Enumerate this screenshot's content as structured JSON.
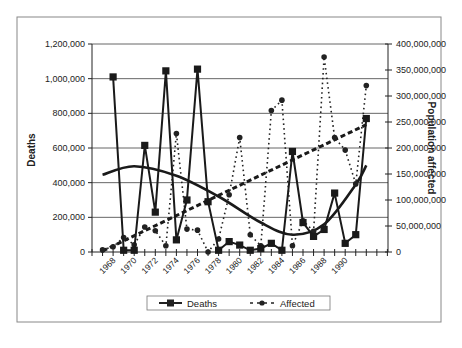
{
  "chart_data": {
    "type": "line",
    "title": "",
    "xlabel": "",
    "ylabel": "Deaths",
    "y2label": "Population affected",
    "ylim": [
      0,
      1200000
    ],
    "y2lim": [
      0,
      400000000
    ],
    "y_ticks": [
      "0",
      "200,000",
      "400,000",
      "600,000",
      "800,000",
      "1,000,000",
      "1,200,000"
    ],
    "y2_ticks": [
      "0",
      "50,000,000",
      "100,000,000",
      "150,000,000",
      "200,000,000",
      "250,000,000",
      "300,000,000",
      "350,000,000",
      "400,000,000"
    ],
    "x_tick_labels": [
      "1968",
      "1970",
      "1972",
      "1974",
      "1976",
      "1978",
      "1980",
      "1982",
      "1984",
      "1986",
      "1988",
      "1990"
    ],
    "x": [
      1967,
      1968,
      1969,
      1970,
      1971,
      1972,
      1973,
      1974,
      1975,
      1976,
      1977,
      1978,
      1979,
      1980,
      1981,
      1982,
      1983,
      1984,
      1985,
      1986,
      1987,
      1988,
      1989,
      1990,
      1991,
      1992
    ],
    "series": [
      {
        "name": "Deaths",
        "axis": "left",
        "style": "solid line, square markers",
        "values": [
          null,
          1010000,
          10000,
          10000,
          615000,
          230000,
          1045000,
          70000,
          300000,
          1055000,
          290000,
          10000,
          60000,
          40000,
          10000,
          20000,
          50000,
          10000,
          580000,
          170000,
          90000,
          130000,
          340000,
          50000,
          100000,
          770000
        ]
      },
      {
        "name": "Affected",
        "axis": "right",
        "style": "dotted line, circle markers",
        "values": [
          4000000,
          10000000,
          28000000,
          14000000,
          48000000,
          41000000,
          12000000,
          228000000,
          44000000,
          42000000,
          0,
          25000000,
          110000000,
          220000000,
          33000000,
          12000000,
          272000000,
          292000000,
          12000000,
          60000000,
          40000000,
          375000000,
          220000000,
          196000000,
          131000000,
          320000000
        ]
      }
    ],
    "trendlines": [
      {
        "name": "Deaths trend",
        "type": "polynomial",
        "style": "thick solid",
        "approx_points": [
          [
            1967,
            445000
          ],
          [
            1970,
            495000
          ],
          [
            1974,
            440000
          ],
          [
            1978,
            320000
          ],
          [
            1982,
            170000
          ],
          [
            1985,
            100000
          ],
          [
            1988,
            160000
          ],
          [
            1991,
            390000
          ],
          [
            1992,
            500000
          ]
        ]
      },
      {
        "name": "Affected trend",
        "type": "linear",
        "style": "thick dashed",
        "approx_points": [
          [
            1967,
            2000000
          ],
          [
            1992,
            245000000
          ]
        ]
      }
    ],
    "grid": true,
    "legend_position": "bottom",
    "legend": [
      "Deaths",
      "Affected"
    ]
  }
}
